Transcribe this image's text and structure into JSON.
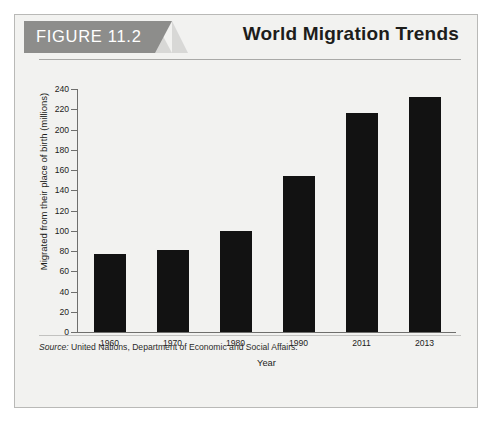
{
  "figure": {
    "tag": "FIGURE 11.2",
    "title": "World Migration Trends",
    "source_label": "Source:",
    "source_text": " United Nations, Department of Economic and Social Affairs."
  },
  "colors": {
    "tag_background": "#8d8d8b",
    "tag_tail": "#d8d8d6",
    "bar": "#121212",
    "panel_background": "#f2f2f0",
    "axis": "#6f6f6d"
  },
  "chart_data": {
    "type": "bar",
    "title": "World Migration Trends",
    "xlabel": "Year",
    "ylabel": "Migrated from their place of birth (millions)",
    "categories": [
      "1960",
      "1970",
      "1980",
      "1990",
      "2011",
      "2013"
    ],
    "values": [
      77,
      81,
      100,
      154,
      216,
      232
    ],
    "ylim": [
      0,
      240
    ],
    "yticks": [
      0,
      20,
      40,
      60,
      80,
      100,
      120,
      140,
      160,
      180,
      200,
      220,
      240
    ],
    "ytick_labels": [
      "0",
      "20",
      "40",
      "60",
      "80",
      "100",
      "120",
      "140",
      "160",
      "180",
      "200",
      "220",
      "240"
    ],
    "grid": false,
    "legend": "none",
    "series": [
      {
        "name": "Migrated from their place of birth (millions)",
        "values": [
          77,
          81,
          100,
          154,
          216,
          232
        ]
      }
    ]
  }
}
